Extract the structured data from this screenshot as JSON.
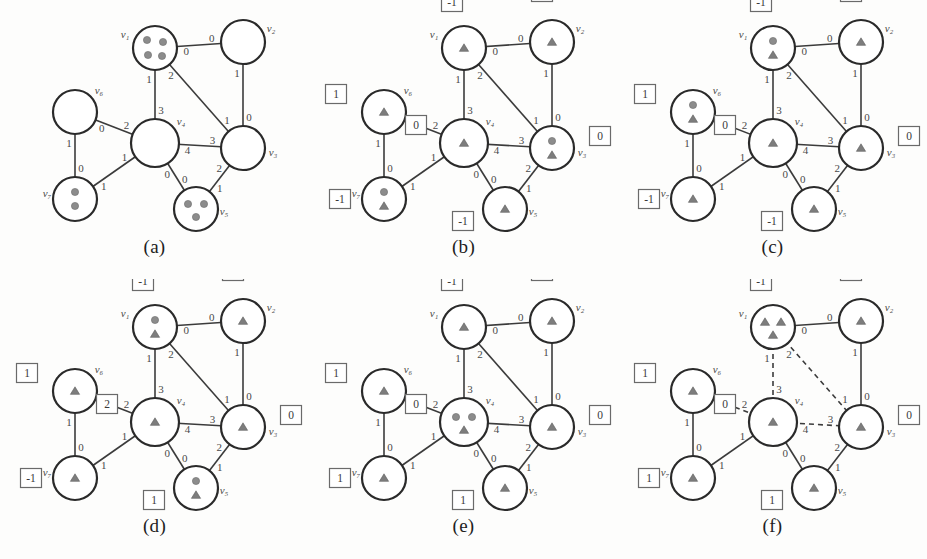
{
  "figure": {
    "panel_count": 6,
    "rows": 2,
    "cols": 3,
    "background_color": "#fdfdfc",
    "edge_color": "#3b3b3b",
    "node_fill": "#ffffff",
    "node_stroke": "#2a2a2a",
    "token_color": "#8c8c8c"
  },
  "graph": {
    "vertices": [
      {
        "id": "v1",
        "label": "v₁",
        "x": 155,
        "y": 48,
        "r": 22,
        "label_dx": -30,
        "label_dy": -10
      },
      {
        "id": "v2",
        "label": "v₂",
        "x": 243,
        "y": 42,
        "r": 22,
        "label_dx": 28,
        "label_dy": -10
      },
      {
        "id": "v3",
        "label": "v₃",
        "x": 243,
        "y": 148,
        "r": 22,
        "label_dx": 30,
        "label_dy": 8
      },
      {
        "id": "v4",
        "label": "v₄",
        "x": 155,
        "y": 143,
        "r": 24,
        "label_dx": 26,
        "label_dy": -18
      },
      {
        "id": "v5",
        "label": "v₅",
        "x": 196,
        "y": 209,
        "r": 22,
        "label_dx": 28,
        "label_dy": 6
      },
      {
        "id": "v6",
        "label": "v₆",
        "x": 75,
        "y": 112,
        "r": 22,
        "label_dx": 24,
        "label_dy": -18
      },
      {
        "id": "v7",
        "label": "v₇",
        "x": 75,
        "y": 199,
        "r": 22,
        "label_dx": -28,
        "label_dy": -2
      }
    ],
    "edges": [
      {
        "from": "v1",
        "to": "v2",
        "port_from": "0",
        "port_to": "0"
      },
      {
        "from": "v2",
        "to": "v3",
        "port_from": "1",
        "port_to": "0"
      },
      {
        "from": "v1",
        "to": "v3",
        "port_from": "2",
        "port_to": "1"
      },
      {
        "from": "v1",
        "to": "v4",
        "port_from": "1",
        "port_to": "3"
      },
      {
        "from": "v4",
        "to": "v3",
        "port_from": "4",
        "port_to": "3"
      },
      {
        "from": "v4",
        "to": "v5",
        "port_from": "0",
        "port_to": "0"
      },
      {
        "from": "v5",
        "to": "v3",
        "port_from": "1",
        "port_to": "2"
      },
      {
        "from": "v6",
        "to": "v4",
        "port_from": "0",
        "port_to": "2"
      },
      {
        "from": "v6",
        "to": "v7",
        "port_from": "1",
        "port_to": "0"
      },
      {
        "from": "v7",
        "to": "v4",
        "port_from": "1",
        "port_to": "1"
      }
    ]
  },
  "panels": [
    {
      "id": "a",
      "caption": "(a)",
      "show_boxes": false,
      "dashed_edges": [],
      "boxes": {},
      "tokens": {
        "v1": {
          "dots": 4,
          "triangles": 0
        },
        "v2": {
          "dots": 0,
          "triangles": 0
        },
        "v3": {
          "dots": 0,
          "triangles": 0
        },
        "v4": {
          "dots": 0,
          "triangles": 0
        },
        "v5": {
          "dots": 3,
          "triangles": 0
        },
        "v6": {
          "dots": 0,
          "triangles": 0
        },
        "v7": {
          "dots": 2,
          "triangles": 0
        }
      }
    },
    {
      "id": "b",
      "caption": "(b)",
      "show_boxes": true,
      "dashed_edges": [],
      "boxes": {
        "v1": "-1",
        "v2": "0",
        "v3": "0",
        "v4": "0",
        "v5": "-1",
        "v6": "1",
        "v7": "-1"
      },
      "tokens": {
        "v1": {
          "dots": 0,
          "triangles": 1
        },
        "v2": {
          "dots": 0,
          "triangles": 1
        },
        "v3": {
          "dots": 1,
          "triangles": 1
        },
        "v4": {
          "dots": 0,
          "triangles": 1
        },
        "v5": {
          "dots": 0,
          "triangles": 1
        },
        "v6": {
          "dots": 0,
          "triangles": 1
        },
        "v7": {
          "dots": 1,
          "triangles": 1
        }
      }
    },
    {
      "id": "c",
      "caption": "(c)",
      "show_boxes": true,
      "dashed_edges": [],
      "boxes": {
        "v1": "-1",
        "v2": "0",
        "v3": "0",
        "v4": "0",
        "v5": "-1",
        "v6": "1",
        "v7": "-1"
      },
      "tokens": {
        "v1": {
          "dots": 1,
          "triangles": 1
        },
        "v2": {
          "dots": 0,
          "triangles": 1
        },
        "v3": {
          "dots": 0,
          "triangles": 1
        },
        "v4": {
          "dots": 0,
          "triangles": 1
        },
        "v5": {
          "dots": 0,
          "triangles": 1
        },
        "v6": {
          "dots": 1,
          "triangles": 1
        },
        "v7": {
          "dots": 0,
          "triangles": 1
        }
      }
    },
    {
      "id": "d",
      "caption": "(d)",
      "show_boxes": true,
      "dashed_edges": [],
      "boxes": {
        "v1": "-1",
        "v2": "0",
        "v3": "0",
        "v4": "2",
        "v5": "1",
        "v6": "1",
        "v7": "-1"
      },
      "tokens": {
        "v1": {
          "dots": 1,
          "triangles": 1
        },
        "v2": {
          "dots": 0,
          "triangles": 1
        },
        "v3": {
          "dots": 0,
          "triangles": 1
        },
        "v4": {
          "dots": 0,
          "triangles": 1
        },
        "v5": {
          "dots": 1,
          "triangles": 1
        },
        "v6": {
          "dots": 0,
          "triangles": 1
        },
        "v7": {
          "dots": 0,
          "triangles": 1
        }
      }
    },
    {
      "id": "e",
      "caption": "(e)",
      "show_boxes": true,
      "dashed_edges": [],
      "boxes": {
        "v1": "-1",
        "v2": "0",
        "v3": "0",
        "v4": "0",
        "v5": "1",
        "v6": "1",
        "v7": "1"
      },
      "tokens": {
        "v1": {
          "dots": 0,
          "triangles": 1
        },
        "v2": {
          "dots": 0,
          "triangles": 1
        },
        "v3": {
          "dots": 0,
          "triangles": 1
        },
        "v4": {
          "dots": 2,
          "triangles": 1
        },
        "v5": {
          "dots": 0,
          "triangles": 1
        },
        "v6": {
          "dots": 0,
          "triangles": 1
        },
        "v7": {
          "dots": 0,
          "triangles": 1
        }
      }
    },
    {
      "id": "f",
      "caption": "(f)",
      "show_boxes": true,
      "dashed_edges": [
        "v1-v4",
        "v1-v3",
        "v4-v3",
        "v6-v4"
      ],
      "boxes": {
        "v1": "-1",
        "v2": "0",
        "v3": "0",
        "v4": "0",
        "v5": "1",
        "v6": "1",
        "v7": "1"
      },
      "tokens": {
        "v1": {
          "dots": 0,
          "triangles": 3
        },
        "v2": {
          "dots": 0,
          "triangles": 1
        },
        "v3": {
          "dots": 0,
          "triangles": 1
        },
        "v4": {
          "dots": 0,
          "triangles": 1
        },
        "v5": {
          "dots": 0,
          "triangles": 1
        },
        "v6": {
          "dots": 0,
          "triangles": 1
        },
        "v7": {
          "dots": 0,
          "triangles": 1
        }
      }
    }
  ],
  "box_positions": {
    "v1": {
      "dx": -12,
      "dy": -46
    },
    "v2": {
      "dx": -10,
      "dy": -50
    },
    "v3": {
      "dx": 48,
      "dy": -12
    },
    "v4": {
      "dx": -48,
      "dy": -18
    },
    "v5": {
      "dx": -42,
      "dy": 12
    },
    "v6": {
      "dx": -48,
      "dy": -18
    },
    "v7": {
      "dx": -44,
      "dy": 0
    }
  }
}
